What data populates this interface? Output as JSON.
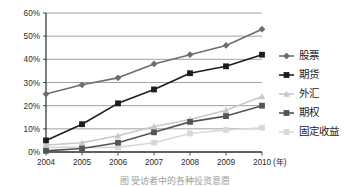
{
  "chart_data": {
    "type": "line",
    "title": "",
    "xlabel": "年",
    "ylabel": "",
    "categories": [
      "2004",
      "2005",
      "2006",
      "2007",
      "2008",
      "2009",
      "2010"
    ],
    "x_unit_label": "(年)",
    "ylim": [
      0,
      60
    ],
    "ytick_labels": [
      "0%",
      "10%",
      "20%",
      "30%",
      "40%",
      "50%",
      "60%"
    ],
    "ytick_values": [
      0,
      10,
      20,
      30,
      40,
      50,
      60
    ],
    "grid": true,
    "legend_position": "right",
    "series": [
      {
        "name": "股票",
        "marker": "diamond",
        "color": "#6d6d6d",
        "values": [
          25,
          29,
          32,
          38,
          42,
          46,
          53
        ]
      },
      {
        "name": "期货",
        "marker": "square",
        "color": "#1c1c1c",
        "values": [
          5,
          12,
          21,
          27,
          34,
          37,
          42
        ]
      },
      {
        "name": "外汇",
        "marker": "triangle",
        "color": "#c8c8c8",
        "values": [
          3,
          4,
          7,
          11,
          14,
          18,
          24
        ]
      },
      {
        "name": "期权",
        "marker": "square",
        "color": "#555555",
        "values": [
          0.5,
          1.5,
          4,
          8.5,
          13,
          15.5,
          20
        ]
      },
      {
        "name": "固定收益",
        "marker": "square",
        "color": "#d8d8d8",
        "values": [
          2,
          2,
          2,
          4,
          8,
          9.5,
          10.5
        ]
      }
    ]
  },
  "legend": {
    "items": [
      {
        "label": "股票"
      },
      {
        "label": "期货"
      },
      {
        "label": "外汇"
      },
      {
        "label": "期权"
      },
      {
        "label": "固定收益"
      }
    ]
  },
  "caption": {
    "text": "图      受访者中的各种投资意愿"
  }
}
